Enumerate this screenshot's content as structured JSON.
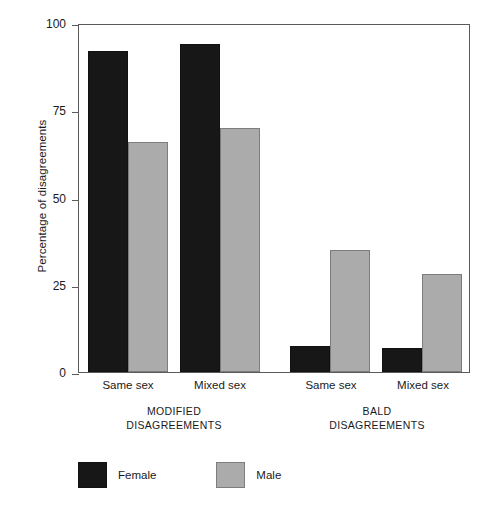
{
  "chart_data": {
    "type": "bar",
    "title": "",
    "subtitle": "",
    "xlabel": "",
    "ylabel": "Percentage of disagreements",
    "ylim": [
      0,
      100
    ],
    "yticks": [
      0,
      25,
      50,
      75,
      100
    ],
    "ytick_labels": [
      "0",
      "25",
      "50",
      "75",
      "100"
    ],
    "grid": false,
    "legend_position": "below-left",
    "categories": [
      "Same sex",
      "Mixed sex",
      "Same sex",
      "Mixed sex"
    ],
    "groups": [
      {
        "name": "MODIFIED DISAGREEMENTS",
        "caption_line1": "MODIFIED",
        "caption_line2": "DISAGREEMENTS",
        "categories": [
          "Same sex",
          "Mixed sex"
        ]
      },
      {
        "name": "BALD DISAGREEMENTS",
        "caption_line1": "BALD",
        "caption_line2": "DISAGREEMENTS",
        "categories": [
          "Same sex",
          "Mixed sex"
        ]
      }
    ],
    "series": [
      {
        "name": "Female",
        "color": "#171717",
        "values": [
          92,
          94,
          7.5,
          7
        ]
      },
      {
        "name": "Male",
        "color": "#ababab",
        "values": [
          66,
          70,
          35,
          28
        ]
      }
    ],
    "bars": [
      {
        "group": "MODIFIED DISAGREEMENTS",
        "category": "Same sex",
        "series": "Female",
        "value": 92
      },
      {
        "group": "MODIFIED DISAGREEMENTS",
        "category": "Same sex",
        "series": "Male",
        "value": 66
      },
      {
        "group": "MODIFIED DISAGREEMENTS",
        "category": "Mixed sex",
        "series": "Female",
        "value": 94
      },
      {
        "group": "MODIFIED DISAGREEMENTS",
        "category": "Mixed sex",
        "series": "Male",
        "value": 70
      },
      {
        "group": "BALD DISAGREEMENTS",
        "category": "Same sex",
        "series": "Female",
        "value": 7.5
      },
      {
        "group": "BALD DISAGREEMENTS",
        "category": "Same sex",
        "series": "Male",
        "value": 35
      },
      {
        "group": "BALD DISAGREEMENTS",
        "category": "Mixed sex",
        "series": "Female",
        "value": 7
      },
      {
        "group": "BALD DISAGREEMENTS",
        "category": "Mixed sex",
        "series": "Male",
        "value": 28
      }
    ],
    "legend": [
      {
        "label": "Female",
        "color": "#171717"
      },
      {
        "label": "Male",
        "color": "#ababab"
      }
    ]
  },
  "axis": {
    "y_title": "Percentage of disagreements",
    "y_labels": [
      "100",
      "75",
      "50",
      "25",
      "0"
    ]
  },
  "group_ticks": [
    "Same sex",
    "Mixed sex",
    "Same sex",
    "Mixed sex"
  ],
  "captions": {
    "left_line1": "MODIFIED",
    "left_line2": "DISAGREEMENTS",
    "right_line1": "BALD",
    "right_line2": "DISAGREEMENTS"
  },
  "legend": {
    "female_label": "Female",
    "male_label": "Male"
  }
}
